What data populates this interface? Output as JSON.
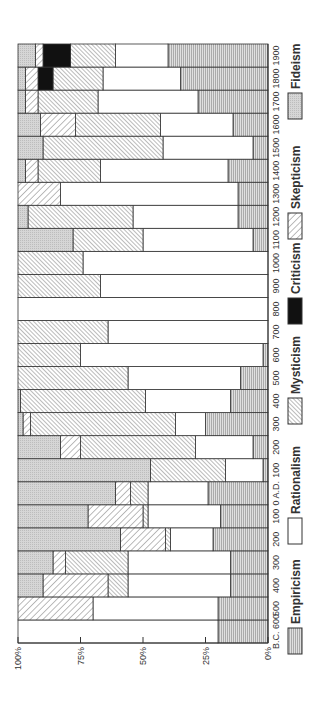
{
  "chart_data": {
    "type": "bar",
    "orientation": "rotated-90 stacked horizontal (100% stacked)",
    "title": "",
    "xlabel": "",
    "ylabel": "",
    "ylim": [
      0,
      100
    ],
    "y_ticks": [
      "0%",
      "25%",
      "50%",
      "75%",
      "100%"
    ],
    "grid": false,
    "legend_position": "right (rotated, below chart)",
    "categories": [
      "B.C. 600",
      "500",
      "400",
      "300",
      "200",
      "100",
      "0 A.D.",
      "100",
      "200",
      "300",
      "400",
      "500",
      "600",
      "700",
      "800",
      "900",
      "1000",
      "1100",
      "1200",
      "1300",
      "1400",
      "1500",
      "1600",
      "1700",
      "1800",
      "1900"
    ],
    "series": [
      {
        "name": "Empiricism",
        "pattern": "horizontal-lines",
        "values": [
          20,
          20,
          15,
          15,
          22,
          19,
          24,
          2,
          6,
          25,
          15,
          11,
          2,
          0,
          0,
          0,
          0,
          6,
          12,
          12,
          16,
          6,
          14,
          28,
          35,
          40
        ]
      },
      {
        "name": "Rationalism",
        "pattern": "white",
        "values": [
          80,
          50,
          41,
          41,
          17,
          29,
          24,
          15,
          23,
          12,
          34,
          45,
          73,
          64,
          100,
          67,
          74,
          44,
          42,
          71,
          51,
          36,
          29,
          40,
          31,
          21
        ]
      },
      {
        "name": "Mysticism",
        "pattern": "dense-backslash",
        "values": [
          0,
          0,
          8,
          25,
          2,
          2,
          7,
          30,
          46,
          58,
          50,
          44,
          25,
          36,
          0,
          33,
          26,
          28,
          42,
          0,
          25,
          48,
          34,
          24,
          20,
          18
        ]
      },
      {
        "name": "Criticism",
        "pattern": "black",
        "values": [
          0,
          0,
          0,
          0,
          0,
          0,
          0,
          0,
          0,
          0,
          0,
          0,
          0,
          0,
          0,
          0,
          0,
          0,
          0,
          0,
          0,
          0,
          0,
          0,
          6,
          11
        ]
      },
      {
        "name": "Skepticism",
        "pattern": "sparse-slash",
        "values": [
          0,
          30,
          26,
          5,
          18,
          22,
          6,
          0,
          8,
          3,
          0,
          0,
          0,
          0,
          0,
          0,
          0,
          0,
          0,
          17,
          5,
          0,
          14,
          5,
          5,
          3
        ]
      },
      {
        "name": "Fideism",
        "pattern": "dotted-gray",
        "values": [
          0,
          0,
          10,
          14,
          41,
          28,
          39,
          53,
          17,
          2,
          1,
          0,
          0,
          0,
          0,
          0,
          0,
          22,
          4,
          0,
          3,
          10,
          9,
          3,
          3,
          7
        ]
      }
    ]
  },
  "axis": {
    "ticks": [
      {
        "label": "100%",
        "value": 100
      },
      {
        "label": "75%",
        "value": 75
      },
      {
        "label": "50%",
        "value": 50
      },
      {
        "label": "25%",
        "value": 25
      },
      {
        "label": "0%",
        "value": 0
      }
    ]
  },
  "legend": [
    {
      "label": "Empiricism",
      "pattern": "horizontal-lines"
    },
    {
      "label": "Rationalism",
      "pattern": "white"
    },
    {
      "label": "Mysticism",
      "pattern": "dense-backslash"
    },
    {
      "label": "Criticism",
      "pattern": "black"
    },
    {
      "label": "Skepticism",
      "pattern": "sparse-slash"
    },
    {
      "label": "Fideism",
      "pattern": "dotted-gray"
    }
  ]
}
